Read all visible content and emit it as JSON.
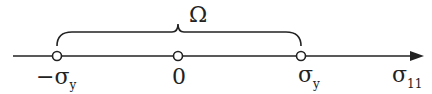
{
  "diagram": {
    "set_label": "Ω",
    "axis_label": "σ",
    "axis_label_sub": "11",
    "points": [
      {
        "label": "−σ",
        "sub": "y",
        "x": 57
      },
      {
        "label": "0",
        "sub": "",
        "x": 178
      },
      {
        "label": "σ",
        "sub": "y",
        "x": 301
      }
    ],
    "colors": {
      "stroke": "#222222",
      "point_fill": "#ffffff"
    }
  }
}
